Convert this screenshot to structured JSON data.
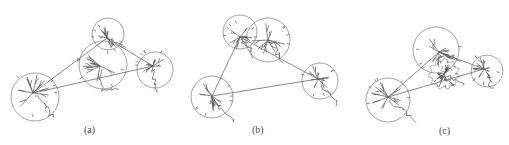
{
  "figure": {
    "panels": [
      {
        "label": "(a)",
        "label_pos": [
          84,
          124
        ],
        "circles": [
          {
            "cx": 35,
            "cy": 97,
            "r": 24
          },
          {
            "cx": 108,
            "cy": 34,
            "r": 16
          },
          {
            "cx": 103,
            "cy": 65,
            "r": 24
          },
          {
            "cx": 155,
            "cy": 70,
            "r": 18
          }
        ],
        "links": [
          [
            0,
            1
          ],
          [
            0,
            3
          ],
          [
            1,
            3
          ]
        ],
        "hubs": [
          [
            33,
            93
          ],
          [
            107,
            38
          ],
          [
            100,
            66
          ],
          [
            153,
            66
          ]
        ]
      },
      {
        "label": "(b)",
        "label_pos": [
          252,
          124
        ],
        "circles": [
          {
            "cx": 212,
            "cy": 97,
            "r": 21
          },
          {
            "cx": 240,
            "cy": 32,
            "r": 17
          },
          {
            "cx": 268,
            "cy": 40,
            "r": 22
          },
          {
            "cx": 320,
            "cy": 81,
            "r": 18
          }
        ],
        "links": [
          [
            0,
            1
          ],
          [
            0,
            3
          ],
          [
            1,
            3
          ]
        ],
        "hubs": [
          [
            212,
            96
          ],
          [
            240,
            37
          ],
          [
            268,
            40
          ],
          [
            318,
            79
          ]
        ]
      },
      {
        "label": "(c)",
        "label_pos": [
          439,
          125
        ],
        "circles": [
          {
            "cx": 388,
            "cy": 100,
            "r": 22
          },
          {
            "cx": 436,
            "cy": 50,
            "r": 23
          },
          {
            "cx": 487,
            "cy": 71,
            "r": 16
          }
        ],
        "blob": {
          "cx": 444,
          "cy": 74,
          "r": 14
        },
        "links": [
          [
            0,
            1
          ],
          [
            0,
            2
          ],
          [
            1,
            2
          ]
        ],
        "hubs": [
          [
            388,
            97
          ],
          [
            439,
            52
          ],
          [
            484,
            69
          ]
        ]
      }
    ]
  }
}
